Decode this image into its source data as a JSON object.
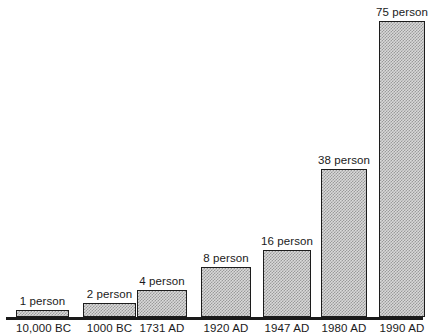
{
  "chart_data": {
    "type": "bar",
    "title": "",
    "subtitle": "",
    "xlabel": "",
    "ylabel": "",
    "grid": false,
    "legend": "none",
    "ylim": [
      0,
      82
    ],
    "categories": [
      "10,000 BC",
      "1000 BC",
      "1731 AD",
      "1920 AD",
      "1947 AD",
      "1980 AD",
      "1990 AD"
    ],
    "values": [
      1,
      2,
      4,
      8,
      16,
      38,
      75
    ],
    "value_labels": [
      "1 person",
      "2 person",
      "4 person",
      "8 person",
      "16 person",
      "38 person",
      "75 person"
    ],
    "unit": "person",
    "bars": [
      {
        "category": "10,000 BC",
        "value": 1,
        "label": "1 person",
        "left_px": 20,
        "width_px": 67,
        "height_px": 7
      },
      {
        "category": "1000 BC",
        "value": 2,
        "label": "2 person",
        "left_px": 104,
        "width_px": 67,
        "height_px": 14
      },
      {
        "category": "1731 AD",
        "value": 4,
        "label": "4 person",
        "left_px": 172,
        "width_px": 63,
        "height_px": 27
      },
      {
        "category": "1920 AD",
        "value": 8,
        "label": "8 person",
        "left_px": 253,
        "width_px": 63,
        "height_px": 50
      },
      {
        "category": "1947 AD",
        "value": 16,
        "label": "16 person",
        "left_px": 331,
        "width_px": 61,
        "height_px": 67
      },
      {
        "category": "1980 AD",
        "value": 38,
        "label": "38 person",
        "left_px": 404,
        "width_px": 58,
        "height_px": 148
      },
      {
        "category": "1990 AD",
        "value": 75,
        "label": "75 person",
        "left_px": 477,
        "width_px": 58,
        "height_px": 296
      }
    ]
  },
  "colors": {
    "axis": "#1a1a1a",
    "bar_border": "#1c1c1c",
    "bar_fill_light": "#d9d9d9",
    "bar_fill_dark": "#9a9a9a",
    "text": "#1a1a1a",
    "background": "#ffffff"
  }
}
